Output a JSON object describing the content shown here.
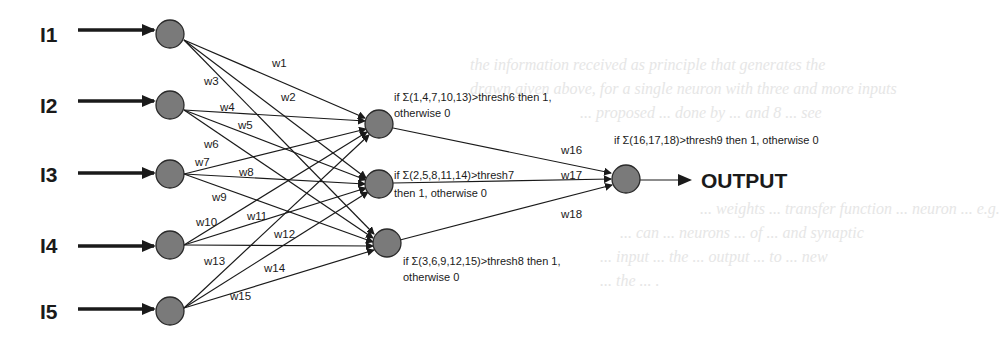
{
  "background_text": [
    "the information received as principle that generates the",
    "drawn given above, for a single neuron with three and more inputs",
    "... proposed ... done by ... and 8 ... see",
    "... weights ... transfer function ... neuron ... e.g.",
    "... can ... neurons ... of ... and synaptic",
    "... input ... the ... output ... to ... new",
    "... the ... ."
  ],
  "inputs": [
    {
      "label": "I1",
      "x": 170,
      "y": 34
    },
    {
      "label": "I2",
      "x": 170,
      "y": 105
    },
    {
      "label": "I3",
      "x": 170,
      "y": 174
    },
    {
      "label": "I4",
      "x": 170,
      "y": 245
    },
    {
      "label": "I5",
      "x": 170,
      "y": 311
    }
  ],
  "hidden": [
    {
      "id": "h6",
      "x": 379,
      "y": 124,
      "rule_line1": "if Σ(1,4,7,10,13)>thresh6 then 1,",
      "rule_line2": "otherwise 0"
    },
    {
      "id": "h7",
      "x": 379,
      "y": 184,
      "rule_line1": "if Σ(2,5,8,11,14)>thresh7",
      "rule_line2": "then 1, otherwise 0"
    },
    {
      "id": "h8",
      "x": 387,
      "y": 243,
      "rule_line1": "if Σ(3,6,9,12,15)>thresh8 then 1,",
      "rule_line2": "otherwise 0"
    }
  ],
  "output": {
    "x": 626,
    "y": 179,
    "rule": "if Σ(16,17,18)>thresh9 then 1, otherwise 0",
    "label": "OUTPUT"
  },
  "weights": {
    "w1": "w1",
    "w2": "w2",
    "w3": "w3",
    "w4": "w4",
    "w5": "w5",
    "w6": "w6",
    "w7": "w7",
    "w8": "w8",
    "w9": "w9",
    "w10": "w10",
    "w11": "w11",
    "w12": "w12",
    "w13": "w13",
    "w14": "w14",
    "w15": "w15",
    "w16": "w16",
    "w17": "w17",
    "w18": "w18"
  },
  "colors": {
    "node_fill": "#7a7a7a",
    "stroke": "#1a1a1a"
  }
}
